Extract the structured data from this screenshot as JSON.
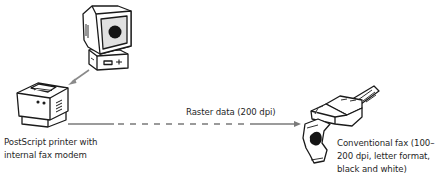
{
  "diagram": {
    "nodes": [
      {
        "id": "computer",
        "icon": "computer-monitor-icon",
        "label": ""
      },
      {
        "id": "printer",
        "icon": "postscript-printer-icon",
        "label_lines": [
          "PostScript printer with",
          "internal fax modem"
        ]
      },
      {
        "id": "fax",
        "icon": "fax-machine-icon",
        "label_lines": [
          "Conventional fax (100–",
          "200  dpi, letter format,",
          "black and white)"
        ]
      }
    ],
    "edges": [
      {
        "from": "computer",
        "to": "printer",
        "style": "solid",
        "color": "#808080",
        "label": ""
      },
      {
        "from": "printer",
        "to": "fax",
        "style": "solid-dashed-solid",
        "color": "#7a7a7a",
        "label": "Raster data (200 dpi)"
      }
    ]
  },
  "colors": {
    "line": "#1a1a1a",
    "arrow": "#7f7f7f",
    "screen_fill": "#e0e0e0",
    "background": "#ffffff"
  }
}
